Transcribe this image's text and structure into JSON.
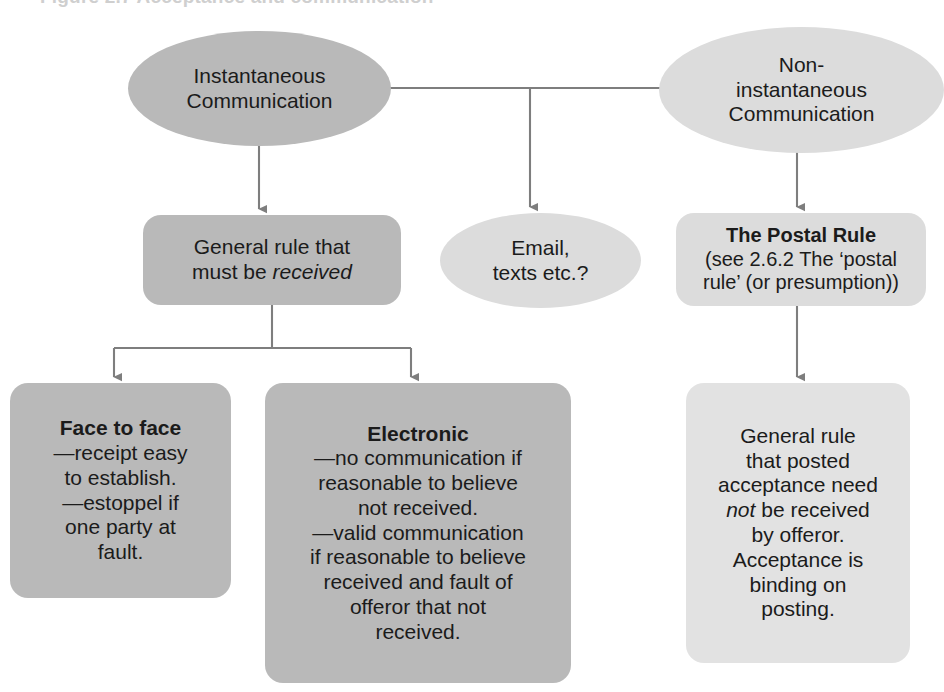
{
  "diagram": {
    "cropped_header_text": "Figure 2.7 Acceptance and communication",
    "colors": {
      "node_dark": "#b9b9b9",
      "node_mid": "#c4c4c4",
      "node_light": "#dcdcdc",
      "node_lighter": "#e2e2e2",
      "connector": "#7a7a7a",
      "text": "#1b1b1b",
      "background": "#ffffff"
    },
    "nodes": {
      "instantaneous": {
        "shape": "ellipse",
        "fill": "#b9b9b9",
        "line1": "Instantaneous",
        "line2": "Communication"
      },
      "non_instantaneous": {
        "shape": "ellipse",
        "fill": "#dcdcdc",
        "line1": "Non-",
        "line2": "instantaneous",
        "line3": "Communication"
      },
      "general_rule_received": {
        "shape": "rounded-box",
        "fill": "#b9b9b9",
        "line1": "General rule that",
        "line2_prefix": "must be ",
        "line2_italic": "received"
      },
      "email_texts": {
        "shape": "ellipse",
        "fill": "#dcdcdc",
        "line1": "Email,",
        "line2": "texts etc.?"
      },
      "postal_rule": {
        "shape": "rounded-box",
        "fill": "#dcdcdc",
        "title": "The Postal Rule",
        "sub_line1": "(see 2.6.2 The ‘postal",
        "sub_line2": "rule’ (or presumption))"
      },
      "face_to_face": {
        "shape": "rounded-box",
        "fill": "#b9b9b9",
        "title": "Face to face",
        "line1": "—receipt easy",
        "line2": "to establish.",
        "line3": "—estoppel if",
        "line4": "one party at",
        "line5": "fault."
      },
      "electronic": {
        "shape": "rounded-box",
        "fill": "#b9b9b9",
        "title": "Electronic",
        "line1": "—no communication if",
        "line2": "reasonable to believe",
        "line3": "not received.",
        "line4": "—valid communication",
        "line5": "if reasonable to believe",
        "line6": "received and fault of",
        "line7": "offeror that not",
        "line8": "received."
      },
      "posted_acceptance": {
        "shape": "rounded-box",
        "fill": "#e2e2e2",
        "line1": "General rule",
        "line2": "that posted",
        "line3": "acceptance need",
        "line4_italic": "not",
        "line4_rest": " be received",
        "line5": "by offeror.",
        "line6": "Acceptance is",
        "line7": "binding on",
        "line8": "posting."
      }
    },
    "edges": [
      {
        "from": "instantaneous",
        "to": "non_instantaneous",
        "style": "plain-horizontal"
      },
      {
        "from": "instantaneous",
        "to": "general_rule_received",
        "style": "arrow-down"
      },
      {
        "from": "instantaneous-noninstantaneous-link",
        "to": "email_texts",
        "style": "arrow-down"
      },
      {
        "from": "non_instantaneous",
        "to": "postal_rule",
        "style": "arrow-down"
      },
      {
        "from": "general_rule_received",
        "to": "face_to_face",
        "style": "fork-arrow-down"
      },
      {
        "from": "general_rule_received",
        "to": "electronic",
        "style": "fork-arrow-down"
      },
      {
        "from": "postal_rule",
        "to": "posted_acceptance",
        "style": "arrow-down"
      }
    ]
  }
}
